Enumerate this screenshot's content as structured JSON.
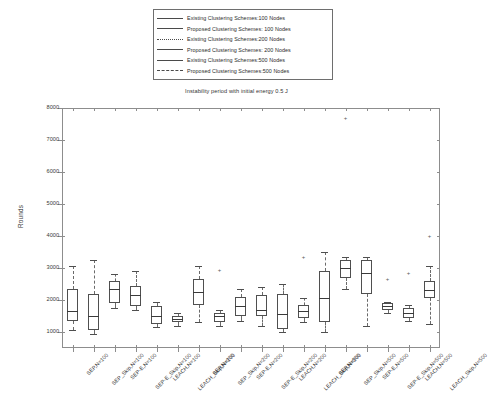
{
  "chart_data": {
    "type": "box",
    "title": "Instability period with initial energy 0.5 J",
    "xlabel": "",
    "ylabel": "Rounds",
    "ylim": [
      500,
      8000
    ],
    "yticks": [
      1000,
      2000,
      3000,
      4000,
      5000,
      6000,
      7000,
      8000
    ],
    "ytick_labels": [
      "1000",
      "2000",
      "3000",
      "4000",
      "5000",
      "6000",
      "7000",
      "8000"
    ],
    "grid": false,
    "legend_position": "above-plot",
    "legend": [
      {
        "label": "Existing Clustering Schemes:100 Nodes",
        "style": "solid"
      },
      {
        "label": "Proposed Clustering Schemes: 100 Nodes",
        "style": "solid"
      },
      {
        "label": "Existing Clustering Schemes:200 Nodes",
        "style": "dotted"
      },
      {
        "label": "Proposed Clustering Schemes: 200 Nodes",
        "style": "solid"
      },
      {
        "label": "Existing Clustering Schemes:500 Nodes",
        "style": "solid"
      },
      {
        "label": "Proposed Clustering Schemes:500 Nodes",
        "style": "dashed"
      }
    ],
    "categories": [
      "SEP,N=100",
      "SEP_Skip,N=100",
      "SEP-E,N=100",
      "SEP-E_Skip,N=100",
      "LEACH,N=100",
      "LEACH_Skip,N=100",
      "SEP,N=200",
      "SEP_Skip,N=200",
      "SEP-E,N=200",
      "SEP-E_Skip,N=200",
      "LEACH,N=200",
      "LEACH_Skip,N=200",
      "SEP,N=500",
      "SEP_Skip,N=500",
      "SEP-E,N=500",
      "SEP-E_Skip,N=500",
      "LEACH,N=500",
      "LEACH_Skip,N=500"
    ],
    "boxes": [
      {
        "category": "SEP,N=100",
        "q1": 1350,
        "median": 1650,
        "q3": 2350,
        "whisker_low": 1050,
        "whisker_high": 3050,
        "outliers": []
      },
      {
        "category": "SEP_Skip,N=100",
        "q1": 1050,
        "median": 1500,
        "q3": 2200,
        "whisker_low": 950,
        "whisker_high": 3250,
        "outliers": []
      },
      {
        "category": "SEP-E,N=100",
        "q1": 1900,
        "median": 2350,
        "q3": 2600,
        "whisker_low": 1750,
        "whisker_high": 2800,
        "outliers": []
      },
      {
        "category": "SEP-E_Skip,N=100",
        "q1": 1800,
        "median": 2150,
        "q3": 2450,
        "whisker_low": 1700,
        "whisker_high": 2900,
        "outliers": []
      },
      {
        "category": "LEACH,N=100",
        "q1": 1250,
        "median": 1500,
        "q3": 1800,
        "whisker_low": 1150,
        "whisker_high": 1950,
        "outliers": []
      },
      {
        "category": "LEACH_Skip,N=100",
        "q1": 1300,
        "median": 1400,
        "q3": 1500,
        "whisker_low": 1200,
        "whisker_high": 1600,
        "outliers": []
      },
      {
        "category": "SEP,N=200",
        "q1": 1850,
        "median": 2250,
        "q3": 2650,
        "whisker_low": 1300,
        "whisker_high": 3050,
        "outliers": []
      },
      {
        "category": "SEP_Skip,N=200",
        "q1": 1300,
        "median": 1500,
        "q3": 1600,
        "whisker_low": 1200,
        "whisker_high": 1700,
        "outliers": [
          2950
        ]
      },
      {
        "category": "SEP-E,N=200",
        "q1": 1500,
        "median": 1800,
        "q3": 2100,
        "whisker_low": 1350,
        "whisker_high": 2350,
        "outliers": []
      },
      {
        "category": "SEP-E_Skip,N=200",
        "q1": 1500,
        "median": 1700,
        "q3": 2150,
        "whisker_low": 1200,
        "whisker_high": 2400,
        "outliers": []
      },
      {
        "category": "LEACH,N=200",
        "q1": 1100,
        "median": 1550,
        "q3": 2200,
        "whisker_low": 1000,
        "whisker_high": 2500,
        "outliers": []
      },
      {
        "category": "LEACH_Skip,N=200",
        "q1": 1450,
        "median": 1650,
        "q3": 1850,
        "whisker_low": 1300,
        "whisker_high": 2050,
        "outliers": [
          3350
        ]
      },
      {
        "category": "SEP,N=500",
        "q1": 1300,
        "median": 2050,
        "q3": 2900,
        "whisker_low": 1000,
        "whisker_high": 3500,
        "outliers": []
      },
      {
        "category": "SEP_Skip,N=500",
        "q1": 2700,
        "median": 3000,
        "q3": 3250,
        "whisker_low": 2350,
        "whisker_high": 3350,
        "outliers": [
          7700
        ]
      },
      {
        "category": "SEP-E,N=500",
        "q1": 2200,
        "median": 2850,
        "q3": 3250,
        "whisker_low": 1200,
        "whisker_high": 3350,
        "outliers": []
      },
      {
        "category": "SEP-E_Skip,N=500",
        "q1": 1700,
        "median": 1800,
        "q3": 1900,
        "whisker_low": 1600,
        "whisker_high": 1950,
        "outliers": [
          2650
        ]
      },
      {
        "category": "LEACH,N=500",
        "q1": 1450,
        "median": 1600,
        "q3": 1750,
        "whisker_low": 1350,
        "whisker_high": 1850,
        "outliers": [
          2850
        ]
      },
      {
        "category": "LEACH_Skip,N=500",
        "q1": 2050,
        "median": 2300,
        "q3": 2600,
        "whisker_low": 1250,
        "whisker_high": 3050,
        "outliers": [
          4000
        ]
      }
    ]
  }
}
